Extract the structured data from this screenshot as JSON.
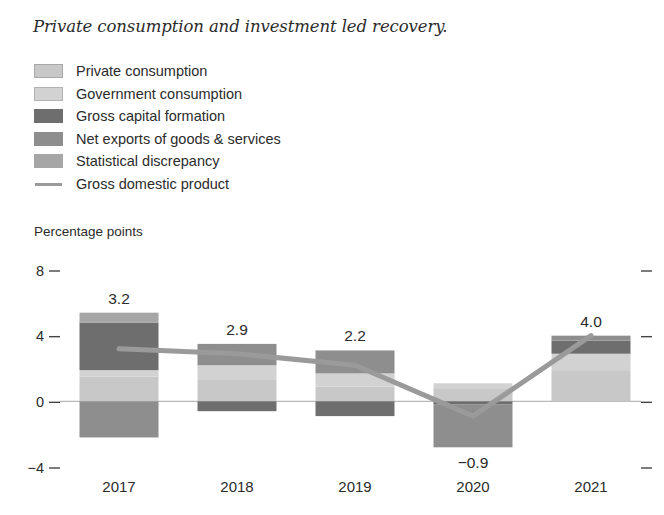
{
  "figure": {
    "title": "Private consumption and investment led recovery.",
    "axis_unit_label": "Percentage points"
  },
  "legend": {
    "items": [
      {
        "label": "Private consumption",
        "swatch": "square-swatch-icon",
        "color": "#c8c8c8",
        "border": "#a8a8a8"
      },
      {
        "label": "Government consumption",
        "swatch": "square-swatch-icon",
        "color": "#d2d2d2",
        "border": "#b2b2b2"
      },
      {
        "label": "Gross capital formation",
        "swatch": "square-swatch-icon",
        "color": "#6e6e6e",
        "border": "#6e6e6e"
      },
      {
        "label": "Net exports of goods & services",
        "swatch": "square-swatch-icon",
        "color": "#8e8e8e",
        "border": "#8e8e8e"
      },
      {
        "label": "Statistical discrepancy",
        "swatch": "square-swatch-icon",
        "color": "#a6a6a6",
        "border": "#a6a6a6"
      },
      {
        "label": "Gross domestic product",
        "swatch": "line-swatch-icon",
        "color": "#9a9a9a",
        "border": "none"
      }
    ]
  },
  "chart_data": {
    "type": "bar",
    "subtype": "stacked-bar-with-line",
    "title": "Private consumption and investment led recovery.",
    "xlabel": "",
    "ylabel": "Percentage points",
    "ylim": [
      -4,
      8
    ],
    "yticks": [
      -4,
      0,
      4,
      8
    ],
    "ytick_labels": [
      "−4",
      "0",
      "4",
      "8"
    ],
    "grid": false,
    "legend_position": "top-left",
    "categories": [
      "2017",
      "2018",
      "2019",
      "2020",
      "2021"
    ],
    "series": [
      {
        "name": "Private consumption",
        "color": "#c8c8c8",
        "values": [
          1.5,
          1.3,
          0.9,
          0.8,
          1.9
        ]
      },
      {
        "name": "Government consumption",
        "color": "#d2d2d2",
        "values": [
          0.4,
          0.9,
          0.8,
          0.3,
          1.0
        ]
      },
      {
        "name": "Gross capital formation",
        "color": "#6e6e6e",
        "values": [
          2.9,
          -0.6,
          -0.9,
          -0.2,
          0.8
        ]
      },
      {
        "name": "Net exports of goods & services",
        "color": "#8e8e8e",
        "values": [
          -2.2,
          1.3,
          1.4,
          -2.6,
          0.3
        ]
      },
      {
        "name": "Statistical discrepancy",
        "color": "#a6a6a6",
        "values": [
          0.6,
          0.0,
          0.0,
          0.0,
          0.0
        ]
      }
    ],
    "line_series": {
      "name": "Gross domestic product",
      "color": "#9a9a9a",
      "values": [
        3.2,
        2.9,
        2.2,
        -0.9,
        4.0
      ]
    },
    "value_labels": [
      "3.2",
      "2.9",
      "2.2",
      "−0.9",
      "4.0"
    ],
    "value_label_positions": [
      "above",
      "above",
      "above",
      "below",
      "above"
    ]
  }
}
